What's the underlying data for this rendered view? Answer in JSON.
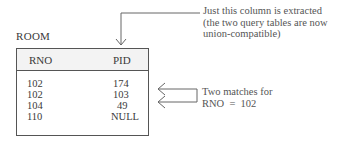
{
  "table": {
    "title": "ROOM",
    "columns": [
      "RNO",
      "PID"
    ],
    "rows": [
      {
        "rno": "102",
        "pid": "174"
      },
      {
        "rno": "102",
        "pid": "103"
      },
      {
        "rno": "104",
        "pid": "49"
      },
      {
        "rno": "110",
        "pid": "NULL"
      }
    ]
  },
  "annotations": {
    "column_extracted": {
      "line1": "Just this column is extracted",
      "line2": "(the two query tables are now",
      "line3": "union-compatible)"
    },
    "matches": {
      "line1": "Two matches for",
      "line2": "RNO  =  102"
    }
  },
  "colors": {
    "line": "#555555",
    "text": "#3a3a3a",
    "header_bg": "#f3f3f3"
  }
}
